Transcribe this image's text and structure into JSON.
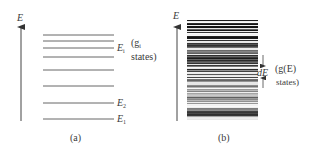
{
  "panel_a": {
    "axis_label": "E",
    "caption": "(a)",
    "levels_y": [
      35,
      41,
      48,
      57,
      70,
      86,
      103,
      119
    ],
    "labels": {
      "ei": {
        "main": "E",
        "sub": "i"
      },
      "ei_note_line1": "(g",
      "ei_note_sub": "i",
      "ei_note_line2": "states)",
      "e2": {
        "main": "E",
        "sub": "2"
      },
      "e1": {
        "main": "E",
        "sub": "1"
      }
    }
  },
  "panel_b": {
    "axis_label": "E",
    "caption": "(b)",
    "interval_label": "dE",
    "note_line1": "(g(E)",
    "note_line2": "states)"
  },
  "colors": {
    "line": "#555555",
    "text": "#3a3a3a",
    "dense_dark": "#222222"
  }
}
